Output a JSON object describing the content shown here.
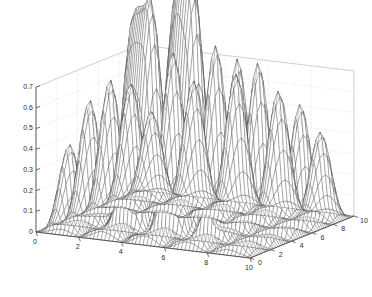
{
  "figure": {
    "kind": "3d-mesh-surface-plot",
    "background_color": "#ffffff",
    "mesh_color": "#3a3a3a",
    "grid_color": "#c8c8c8",
    "axis_color": "#4a4a4a",
    "tick_text_color": "#2b2b2b"
  },
  "axes": {
    "z": {
      "label": "",
      "min": 0,
      "max": 0.7,
      "step": 0.1,
      "ticks": [
        "0",
        "0.1",
        "0.2",
        "0.3",
        "0.4",
        "0.5",
        "0.6",
        "0.7"
      ],
      "tick_values": [
        0,
        0.1,
        0.2,
        0.3,
        0.4,
        0.5,
        0.6,
        0.7
      ]
    },
    "x": {
      "label": "",
      "min": 0,
      "max": 10,
      "step": 2,
      "ticks": [
        "0",
        "2",
        "4",
        "6",
        "8",
        "10"
      ],
      "tick_values": [
        0,
        2,
        4,
        6,
        8,
        10
      ]
    },
    "y": {
      "label": "",
      "min": 0,
      "max": 10,
      "step": 2,
      "ticks": [
        "0",
        "2",
        "4",
        "6",
        "8",
        "10"
      ],
      "tick_values": [
        0,
        2,
        4,
        6,
        8,
        10
      ]
    }
  },
  "chart_data": {
    "type": "line",
    "subtype": "surface-mesh-3d",
    "title": "",
    "subtitle": "",
    "xlabel": "",
    "ylabel": "",
    "zlabel": "",
    "xlim": [
      0,
      10
    ],
    "ylim": [
      0,
      10
    ],
    "zlim": [
      0,
      0.7
    ],
    "grid": true,
    "legend": "none",
    "view": {
      "azimuth": -37.5,
      "elevation": 30,
      "projection": "orthographic"
    },
    "colormap": "grayscale-wireframe",
    "surface_model": {
      "form": "base_lattice + two_tall_gaussian_peaks",
      "base_amplitude": 0.22,
      "base_period_x": 2.0,
      "base_period_y": 2.0,
      "base_envelope": "radial_decay_from_center",
      "peaks": [
        {
          "name": "tall-peak-left",
          "x": 3.0,
          "y": 4.0,
          "height": 1.05,
          "sigma": 0.52
        },
        {
          "name": "tall-peak-right",
          "x": 5.0,
          "y": 4.0,
          "height": 1.3,
          "sigma": 0.52
        }
      ],
      "grid_samples_x": 61,
      "grid_samples_y": 61
    },
    "x": [
      0,
      1,
      2,
      3,
      4,
      5,
      6,
      7,
      8,
      9,
      10
    ],
    "y": [
      0,
      1,
      2,
      3,
      4,
      5,
      6,
      7,
      8,
      9,
      10
    ],
    "z_lattice_peak_heights": [
      [
        0.05,
        0.0,
        0.12,
        0.0,
        0.15,
        0.0,
        0.14,
        0.0,
        0.11,
        0.0,
        0.04
      ],
      [
        0.0,
        0.0,
        0.0,
        0.0,
        0.0,
        0.0,
        0.0,
        0.0,
        0.0,
        0.0,
        0.0
      ],
      [
        0.12,
        0.0,
        0.22,
        0.0,
        0.3,
        0.0,
        0.28,
        0.0,
        0.2,
        0.0,
        0.1
      ],
      [
        0.0,
        0.0,
        0.0,
        0.0,
        0.0,
        0.0,
        0.0,
        0.0,
        0.0,
        0.0,
        0.0
      ],
      [
        0.15,
        0.0,
        0.3,
        0.0,
        1.05,
        0.0,
        1.3,
        0.0,
        0.32,
        0.0,
        0.13
      ],
      [
        0.0,
        0.0,
        0.0,
        0.0,
        0.0,
        0.0,
        0.0,
        0.0,
        0.0,
        0.0,
        0.0
      ],
      [
        0.14,
        0.0,
        0.28,
        0.0,
        0.4,
        0.0,
        0.38,
        0.0,
        0.26,
        0.0,
        0.12
      ],
      [
        0.0,
        0.0,
        0.0,
        0.0,
        0.0,
        0.0,
        0.0,
        0.0,
        0.0,
        0.0,
        0.0
      ],
      [
        0.11,
        0.0,
        0.2,
        0.0,
        0.28,
        0.0,
        0.26,
        0.0,
        0.19,
        0.0,
        0.09
      ],
      [
        0.0,
        0.0,
        0.0,
        0.0,
        0.0,
        0.0,
        0.0,
        0.0,
        0.0,
        0.0,
        0.0
      ],
      [
        0.04,
        0.0,
        0.1,
        0.0,
        0.13,
        0.0,
        0.12,
        0.0,
        0.09,
        0.0,
        0.03
      ]
    ]
  }
}
